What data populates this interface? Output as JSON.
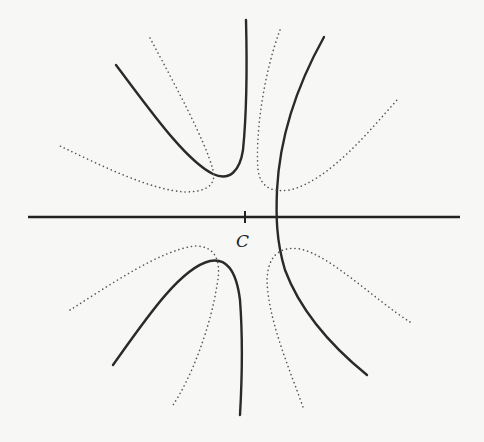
{
  "diagram": {
    "point_label": "C",
    "colors": {
      "background": "#f7f7f5",
      "ink": "#2a2a2a",
      "dotted": "#555555"
    },
    "axis": {
      "orientation": "horizontal",
      "x_start": 28,
      "x_end": 460,
      "y": 217,
      "tick_x": 245
    },
    "curves": {
      "solid": [
        {
          "name": "upper-left-solid",
          "quadrant": "upper-left"
        },
        {
          "name": "right-solid",
          "quadrant": "upper-right-to-lower-right"
        },
        {
          "name": "lower-left-solid",
          "quadrant": "lower-left"
        }
      ],
      "dotted": [
        {
          "name": "upper-left-dotted",
          "quadrant": "upper-left"
        },
        {
          "name": "upper-right-dotted",
          "quadrant": "upper-right"
        },
        {
          "name": "lower-left-dotted",
          "quadrant": "lower-left"
        },
        {
          "name": "lower-right-dotted",
          "quadrant": "lower-right"
        }
      ]
    }
  }
}
